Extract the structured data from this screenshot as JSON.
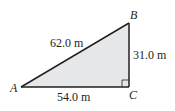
{
  "diagram": {
    "type": "right-triangle",
    "colors": {
      "fill": "#e6e7e8",
      "stroke": "#231f20",
      "text": "#231f20"
    },
    "vertices": {
      "A": {
        "label": "A",
        "x": 21,
        "y": 87
      },
      "B": {
        "label": "B",
        "x": 129,
        "y": 23
      },
      "C": {
        "label": "C",
        "x": 129,
        "y": 87
      }
    },
    "sides": {
      "hypotenuse_AB": {
        "label": "62.0 m"
      },
      "vertical_BC": {
        "label": "31.0 m"
      },
      "base_AC": {
        "label": "54.0 m"
      }
    },
    "right_angle_at": "C"
  }
}
